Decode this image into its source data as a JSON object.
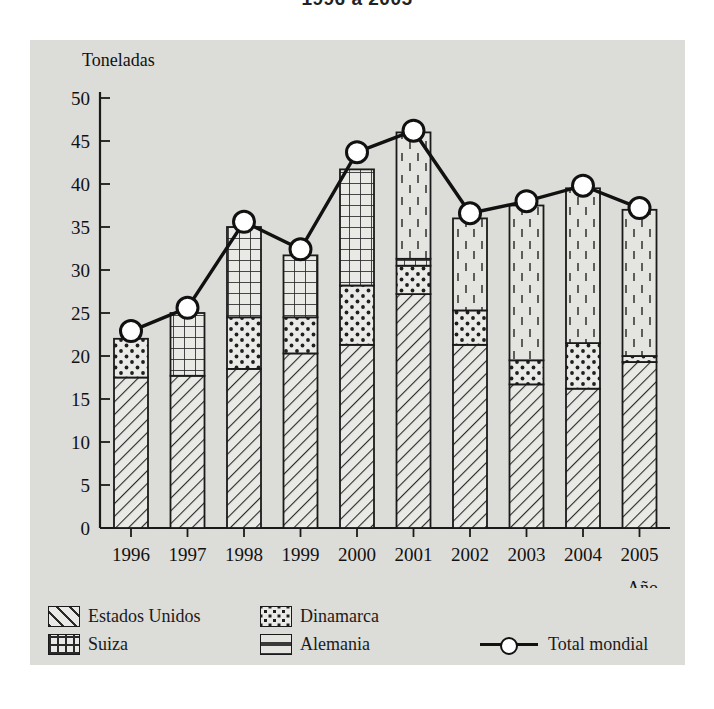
{
  "title": "1996 a 2005",
  "axes": {
    "ylabel": "Toneladas",
    "xlabel": "Año",
    "yticks": [
      "0",
      "5",
      "10",
      "15",
      "20",
      "25",
      "30",
      "35",
      "40",
      "45",
      "50"
    ]
  },
  "legend": {
    "estados_unidos": "Estados Unidos",
    "suiza": "Suiza",
    "dinamarca": "Dinamarca",
    "alemania": "Alemania",
    "total": "Total mondial"
  },
  "colors": {
    "panel": "#dcdcd8",
    "ink": "#1a1a1a",
    "fill": "#e7e7e3",
    "marker_face": "#ffffff"
  },
  "chart_data": {
    "type": "bar",
    "title": "1996 a 2005",
    "xlabel": "Año",
    "ylabel": "Toneladas",
    "ylim": [
      0,
      50
    ],
    "ytick_step": 5,
    "grid": false,
    "legend_position": "bottom",
    "stacked": true,
    "categories": [
      "1996",
      "1997",
      "1998",
      "1999",
      "2000",
      "2001",
      "2002",
      "2003",
      "2004",
      "2005"
    ],
    "series": [
      {
        "name": "Estados Unidos",
        "pattern": "diagonal-hatch",
        "values": [
          17.5,
          17.7,
          18.5,
          20.3,
          21.3,
          27.2,
          21.3,
          16.7,
          16.2,
          19.3
        ]
      },
      {
        "name": "Dinamarca",
        "pattern": "dots",
        "values": [
          4.5,
          0.0,
          6.0,
          4.2,
          6.9,
          3.3,
          4.0,
          2.8,
          5.3,
          0.7
        ]
      },
      {
        "name": "Suiza",
        "pattern": "cross-hatch",
        "values": [
          0.0,
          7.3,
          10.5,
          7.2,
          13.5,
          0.8,
          0.0,
          0.0,
          0.0,
          0.0
        ]
      },
      {
        "name": "Alemania",
        "pattern": "vertical-dashes",
        "values": [
          0.0,
          0.0,
          0.0,
          0.0,
          0.0,
          14.7,
          10.7,
          18.0,
          18.0,
          17.0
        ]
      }
    ],
    "stack_tops": {
      "Estados Unidos": [
        17.5,
        17.7,
        18.5,
        20.3,
        21.3,
        27.2,
        21.3,
        16.7,
        16.2,
        19.3
      ],
      "Dinamarca": [
        22.0,
        17.7,
        24.5,
        24.5,
        28.2,
        30.5,
        25.3,
        19.5,
        21.5,
        20.0
      ],
      "Suiza": [
        22.0,
        25.0,
        35.0,
        31.7,
        41.7,
        31.3,
        25.3,
        19.5,
        21.5,
        20.0
      ],
      "Alemania": [
        22.0,
        25.0,
        35.0,
        31.7,
        41.7,
        46.0,
        36.0,
        37.5,
        39.5,
        37.0
      ]
    },
    "bar_totals": [
      22.0,
      25.0,
      35.0,
      31.7,
      41.7,
      46.0,
      36.0,
      37.5,
      39.5,
      37.0
    ],
    "line_series": {
      "name": "Total mondial",
      "marker": "circle-open",
      "values": [
        22.9,
        25.6,
        35.6,
        32.4,
        43.7,
        46.2,
        36.6,
        38.0,
        39.8,
        37.2
      ]
    }
  }
}
